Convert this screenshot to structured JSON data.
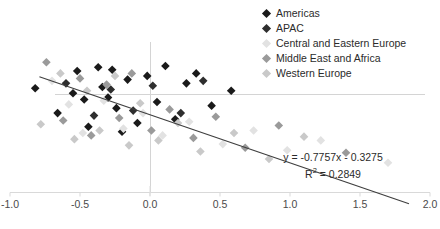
{
  "chart_data": {
    "type": "scatter",
    "title": "",
    "xlabel": "",
    "ylabel": "",
    "xlim": [
      -1.0,
      2.0
    ],
    "ylim": [
      -1.6,
      1.4
    ],
    "xticks": [
      -1.0,
      -0.5,
      0.0,
      0.5,
      1.0,
      1.5,
      2.0
    ],
    "xtick_labels": [
      "-1.0",
      "-0.5",
      "0.0",
      "0.5",
      "1.0",
      "1.5",
      "2.0"
    ],
    "yticks": [],
    "ytick_labels": [],
    "grid": false,
    "legend_position": "top-right",
    "annotations": [
      "y = -0.7757x - 0.3275",
      "R² = 0.2849"
    ],
    "trendline": {
      "slope": -0.7757,
      "intercept": -0.3275,
      "x_start": -0.79,
      "x_end": 1.85,
      "color": "#3f3f3f"
    },
    "series": [
      {
        "name": "Americas",
        "color": "#1a1a1a",
        "points": [
          [
            -0.82,
            0.1
          ],
          [
            -0.66,
            -0.3
          ],
          [
            -0.55,
            0.02
          ],
          [
            -0.52,
            0.38
          ],
          [
            -0.47,
            -0.08
          ],
          [
            -0.44,
            -0.52
          ],
          [
            -0.37,
            0.44
          ],
          [
            -0.34,
            0.12
          ],
          [
            -0.3,
            -0.05
          ],
          [
            -0.27,
            0.4
          ],
          [
            -0.24,
            -0.22
          ],
          [
            -0.2,
            -0.6
          ],
          [
            -0.16,
            0.24
          ],
          [
            -0.09,
            -0.46
          ],
          [
            -0.02,
            0.3
          ],
          [
            0.05,
            -0.12
          ],
          [
            0.11,
            0.46
          ],
          [
            0.18,
            -0.4
          ],
          [
            0.26,
            0.18
          ],
          [
            0.33,
            0.34
          ],
          [
            0.44,
            -0.18
          ],
          [
            0.58,
            0.06
          ]
        ]
      },
      {
        "name": "APAC",
        "color": "#2e2e2e",
        "points": [
          [
            -0.6,
            0.18
          ],
          [
            -0.4,
            -0.34
          ],
          [
            -0.28,
            0.08
          ],
          [
            -0.12,
            -0.26
          ],
          [
            0.02,
            0.14
          ],
          [
            0.22,
            -0.3
          ],
          [
            0.38,
            0.22
          ]
        ]
      },
      {
        "name": "Central and Eastern Europe",
        "color": "#e2e2e2",
        "points": [
          [
            -0.7,
            0.22
          ],
          [
            -0.58,
            -0.16
          ],
          [
            -0.48,
            -0.62
          ],
          [
            -0.33,
            -0.1
          ],
          [
            -0.19,
            -0.55
          ],
          [
            -0.05,
            -0.3
          ],
          [
            0.09,
            -0.66
          ],
          [
            0.28,
            -0.44
          ],
          [
            0.52,
            -0.8
          ],
          [
            0.74,
            -0.58
          ],
          [
            0.98,
            -0.9
          ],
          [
            1.22,
            -0.74
          ],
          [
            1.7,
            -1.1
          ]
        ]
      },
      {
        "name": "Middle East and Africa",
        "color": "#9a9a9a",
        "points": [
          [
            -0.74,
            0.52
          ],
          [
            -0.62,
            -0.42
          ],
          [
            -0.5,
            0.26
          ],
          [
            -0.42,
            -0.66
          ],
          [
            -0.31,
            0.16
          ],
          [
            -0.22,
            -0.38
          ],
          [
            -0.13,
            0.34
          ],
          [
            0.01,
            -0.58
          ],
          [
            0.14,
            -0.24
          ],
          [
            0.31,
            -0.7
          ],
          [
            0.47,
            -0.36
          ],
          [
            0.68,
            -0.86
          ],
          [
            0.92,
            -0.5
          ],
          [
            1.4,
            -0.94
          ]
        ]
      },
      {
        "name": "Western Europe",
        "color": "#c9c9c9",
        "points": [
          [
            -0.78,
            -0.48
          ],
          [
            -0.64,
            0.34
          ],
          [
            -0.54,
            -0.72
          ],
          [
            -0.45,
            0.06
          ],
          [
            -0.36,
            -0.58
          ],
          [
            -0.25,
            0.3
          ],
          [
            -0.15,
            -0.82
          ],
          [
            -0.07,
            -0.14
          ],
          [
            0.06,
            -0.74
          ],
          [
            0.2,
            -0.46
          ],
          [
            0.36,
            -0.92
          ],
          [
            0.6,
            -0.62
          ],
          [
            0.85,
            -1.04
          ],
          [
            1.1,
            -0.68
          ]
        ]
      }
    ]
  },
  "legend": {
    "items": [
      {
        "label": "Americas",
        "color": "#1a1a1a"
      },
      {
        "label": "APAC",
        "color": "#2e2e2e"
      },
      {
        "label": "Central and Eastern Europe",
        "color": "#e2e2e2"
      },
      {
        "label": "Middle East and Africa",
        "color": "#9a9a9a"
      },
      {
        "label": "Western Europe",
        "color": "#c9c9c9"
      }
    ]
  },
  "equation": {
    "line1": "y = -0.7757x - 0.3275",
    "line2_prefix": "R",
    "line2_sup": "2",
    "line2_suffix": " = 0.2849"
  },
  "axes": {
    "axis_color": "#d0d0d0",
    "tick_label_color": "#4a4a4a"
  }
}
